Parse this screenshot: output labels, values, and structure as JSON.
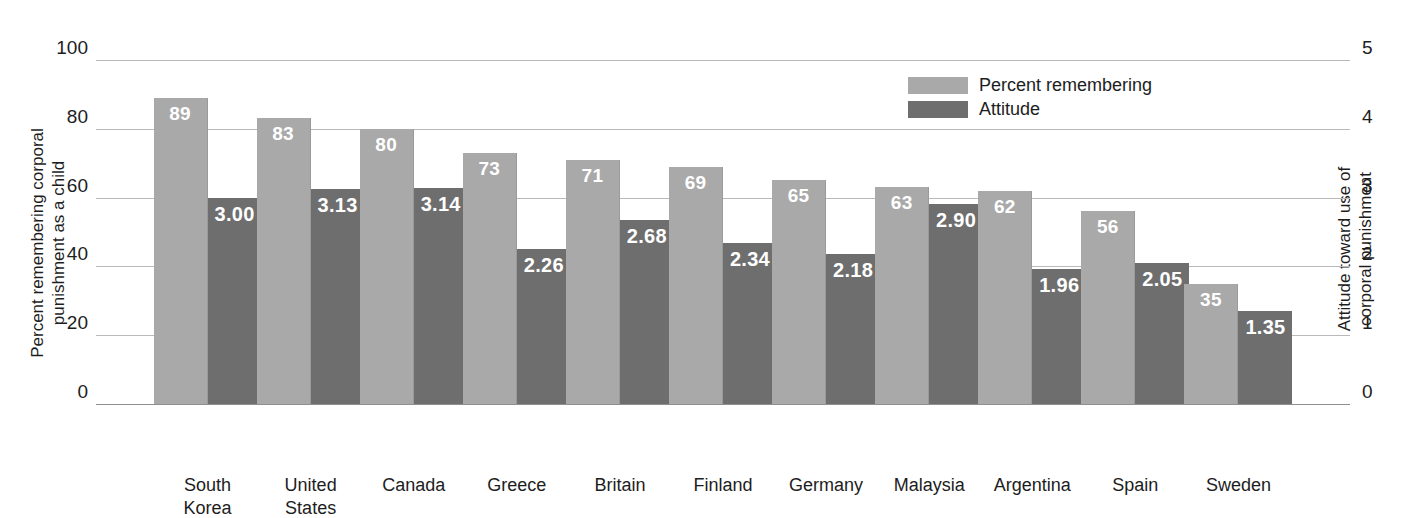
{
  "chart_data": {
    "type": "bar",
    "title": "",
    "subtitle": "",
    "xlabel": "",
    "ylabel": "Percent remembering corporal\npunishment as a child",
    "ylabel_right": "Attitude toward use of\ncorporal punishment",
    "categories": [
      "South\nKorea",
      "United\nStates",
      "Canada",
      "Greece",
      "Britain",
      "Finland",
      "Germany",
      "Malaysia",
      "Argentina",
      "Spain",
      "Sweden"
    ],
    "series": [
      {
        "name": "Percent remembering",
        "axis": "left",
        "color": "#a9a9a9",
        "values": [
          89,
          83,
          80,
          73,
          71,
          69,
          65,
          63,
          62,
          56,
          35
        ],
        "labels": [
          "89",
          "83",
          "80",
          "73",
          "71",
          "69",
          "65",
          "63",
          "62",
          "56",
          "35"
        ]
      },
      {
        "name": "Attitude",
        "axis": "right",
        "color": "#6e6e6e",
        "values": [
          3.0,
          3.13,
          3.14,
          2.26,
          2.68,
          2.34,
          2.18,
          2.9,
          1.96,
          2.05,
          1.35
        ],
        "labels": [
          "3.00",
          "3.13",
          "3.14",
          "2.26",
          "2.68",
          "2.34",
          "2.18",
          "2.90",
          "1.96",
          "2.05",
          "1.35"
        ]
      }
    ],
    "ylim": [
      0,
      100
    ],
    "ylim_right": [
      0,
      5
    ],
    "yticks": [
      0,
      20,
      40,
      60,
      80,
      100
    ],
    "yticks_right": [
      0,
      1,
      2,
      3,
      4,
      5
    ],
    "ytick_labels": [
      "0",
      "20",
      "40",
      "60",
      "80",
      "100"
    ],
    "ytick_labels_right": [
      "0",
      "1",
      "2",
      "3",
      "4",
      "5"
    ],
    "grid": true,
    "legend_position": "top-right"
  },
  "legend": {
    "items": [
      {
        "label": "Percent remembering",
        "color": "#a9a9a9"
      },
      {
        "label": "Attitude",
        "color": "#6e6e6e"
      }
    ]
  }
}
